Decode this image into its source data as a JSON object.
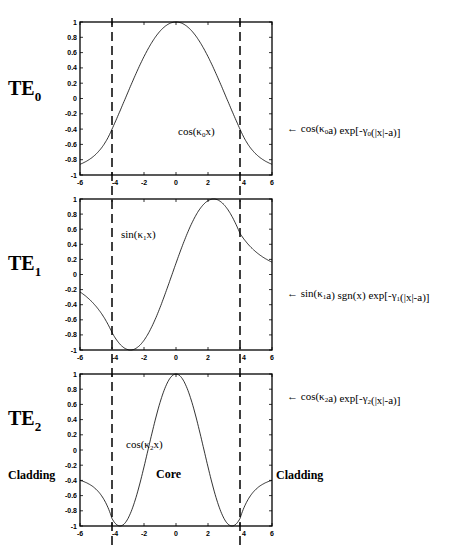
{
  "figure": {
    "panels": [
      {
        "mode_label": "TE",
        "mode_index": "0",
        "inner_label": {
          "pre": "cos(κ",
          "sub": "0",
          "post": "x)"
        },
        "outer_label": {
          "parts": [
            [
              "cos(κ",
              ""
            ],
            [
              "0",
              "sub"
            ],
            [
              "a) exp[-γ",
              ""
            ],
            [
              "0",
              "sub"
            ],
            [
              "(|x|-a)]",
              ""
            ]
          ]
        }
      },
      {
        "mode_label": "TE",
        "mode_index": "1",
        "inner_label": {
          "pre": "sin(κ",
          "sub": "1",
          "post": "x)"
        },
        "outer_label": {
          "parts": [
            [
              "sin(κ",
              ""
            ],
            [
              "1",
              "sub"
            ],
            [
              "a) sgn(x) exp[-γ",
              ""
            ],
            [
              "1",
              "sub"
            ],
            [
              "(|x|-a)]",
              ""
            ]
          ]
        }
      },
      {
        "mode_label": "TE",
        "mode_index": "2",
        "inner_label": {
          "pre": "cos(κ",
          "sub": "2",
          "post": "x)"
        },
        "outer_label": {
          "parts": [
            [
              "cos(κ",
              ""
            ],
            [
              "2",
              "sub"
            ],
            [
              "a) exp[-γ",
              ""
            ],
            [
              "2",
              "sub"
            ],
            [
              "(|x|-a)]",
              ""
            ]
          ]
        }
      }
    ],
    "region_labels": {
      "left": "Cladding",
      "center": "Core",
      "right": "Cladding"
    },
    "arrow_glyph": "←"
  },
  "chart_data": [
    {
      "type": "line",
      "title": "TE0",
      "xlabel": "",
      "ylabel": "",
      "xlim": [
        -6,
        6
      ],
      "ylim": [
        -1,
        1
      ],
      "xticks": [
        -6,
        -4,
        -2,
        0,
        2,
        4,
        6
      ],
      "yticks": [
        1,
        0.8,
        0.6,
        0.4,
        0.2,
        0,
        -0.2,
        -0.4,
        -0.6,
        -0.8,
        -1
      ],
      "grid": false,
      "vlines_dashed": [
        -4,
        4
      ],
      "annotations": [
        "cos(κ0x)",
        "cos(κ0a) exp[-γ0(|x|-a)]"
      ],
      "series": [
        {
          "name": "TE0 field",
          "x": [
            -6,
            -5,
            -4,
            -3,
            -2,
            -1,
            0,
            1,
            2,
            3,
            4,
            5,
            6
          ],
          "values": [
            -0.86,
            -0.72,
            -0.4,
            0.0,
            0.4,
            0.8,
            1.0,
            0.8,
            0.4,
            0.0,
            -0.4,
            -0.72,
            -0.86
          ]
        }
      ]
    },
    {
      "type": "line",
      "title": "TE1",
      "xlabel": "",
      "ylabel": "",
      "xlim": [
        -6,
        6
      ],
      "ylim": [
        -1,
        1
      ],
      "xticks": [
        -6,
        -4,
        -2,
        0,
        2,
        4,
        6
      ],
      "yticks": [
        1,
        0.8,
        0.6,
        0.4,
        0.2,
        0,
        -0.2,
        -0.4,
        -0.6,
        -0.8,
        -1
      ],
      "grid": false,
      "vlines_dashed": [
        -4,
        4
      ],
      "annotations": [
        "sin(κ1x)",
        "sin(κ1a) sgn(x) exp[-γ1(|x|-a)]"
      ],
      "series": [
        {
          "name": "TE1 field",
          "x": [
            -6,
            -5,
            -4,
            -3,
            -2.6,
            -2,
            -1,
            0,
            1,
            2,
            2.6,
            3,
            4,
            5,
            6
          ],
          "values": [
            -0.12,
            -0.3,
            -0.62,
            -0.97,
            -1.0,
            -0.9,
            -0.55,
            0.15,
            0.7,
            0.98,
            1.0,
            0.97,
            0.62,
            0.35,
            0.18
          ]
        }
      ]
    },
    {
      "type": "line",
      "title": "TE2",
      "xlabel": "",
      "ylabel": "",
      "xlim": [
        -6,
        6
      ],
      "ylim": [
        -1,
        1
      ],
      "xticks": [
        -6,
        -4,
        -2,
        0,
        2,
        4,
        6
      ],
      "yticks": [
        1,
        0.8,
        0.6,
        0.4,
        0.2,
        0,
        -0.2,
        -0.4,
        -0.6,
        -0.8,
        -1
      ],
      "grid": false,
      "vlines_dashed": [
        -4,
        4
      ],
      "annotations": [
        "cos(κ2x)",
        "cos(κ2a) exp[-γ2(|x|-a)]",
        "Cladding",
        "Core",
        "Cladding"
      ],
      "series": [
        {
          "name": "TE2 field",
          "x": [
            -6,
            -5,
            -4,
            -3.5,
            -3,
            -2,
            -1,
            0,
            1,
            2,
            3,
            3.5,
            4,
            5,
            6
          ],
          "values": [
            -0.4,
            -0.6,
            -0.92,
            -1.0,
            -0.93,
            -0.35,
            0.55,
            1.0,
            0.55,
            -0.35,
            -0.93,
            -1.0,
            -0.92,
            -0.6,
            -0.4
          ]
        }
      ]
    }
  ]
}
